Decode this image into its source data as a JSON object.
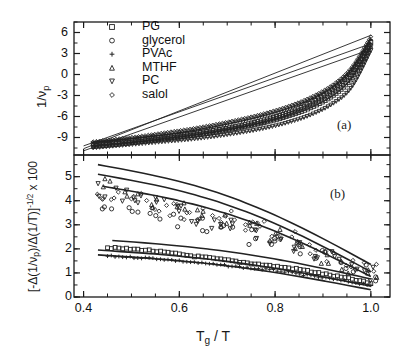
{
  "figure": {
    "xlabel_main": "T",
    "xlabel_sub": "g",
    "xlabel_tail": " / T",
    "panel_a_label": "(a)",
    "panel_b_label": "(b)",
    "ylabel_a_main": "1/",
    "ylabel_a_nu": "ν",
    "ylabel_a_sub": "p",
    "ylabel_b_pre": "[-Δ(1/",
    "ylabel_b_nu": "ν",
    "ylabel_b_sub": "p",
    "ylabel_b_mid": ")/Δ(1/T)]",
    "ylabel_b_sup": "-1/2",
    "ylabel_b_tail": " x 100"
  },
  "legend": {
    "title": "",
    "entries": [
      {
        "label": "PG",
        "marker": "square",
        "marker_icon": "square-marker-icon"
      },
      {
        "label": "glycerol",
        "marker": "circle",
        "marker_icon": "circle-marker-icon"
      },
      {
        "label": "PVAc",
        "marker": "plus",
        "marker_icon": "plus-marker-icon"
      },
      {
        "label": "MTHF",
        "marker": "triangle-up",
        "marker_icon": "triangle-up-marker-icon"
      },
      {
        "label": "PC",
        "marker": "triangle-down",
        "marker_icon": "triangle-down-marker-icon"
      },
      {
        "label": "salol",
        "marker": "diamond",
        "marker_icon": "diamond-marker-icon"
      }
    ]
  },
  "chart_data": [
    {
      "type": "line",
      "panel": "a",
      "title": "",
      "xlabel": "T_g / T",
      "ylabel": "1/nu_p",
      "xlim": [
        0.38,
        1.04
      ],
      "ylim": [
        -11.5,
        7.5
      ],
      "xticks": [
        0.4,
        0.6,
        0.8,
        1.0
      ],
      "xtick_labels": [
        "0.4",
        "0.6",
        "0.8",
        "1.0"
      ],
      "yticks": [
        -9,
        -6,
        -3,
        0,
        3,
        6
      ],
      "ytick_labels": [
        "-9",
        "-6",
        "-3",
        "0",
        "3",
        "6"
      ],
      "grid": false,
      "legend_position": "upper-left-inside",
      "series": [
        {
          "name": "PG",
          "marker": "square",
          "x": [
            0.42,
            0.47,
            0.52,
            0.57,
            0.62,
            0.67,
            0.72,
            0.77,
            0.82,
            0.87,
            0.92,
            0.96,
            1.0
          ],
          "y": [
            -9.9,
            -9.6,
            -9.3,
            -8.9,
            -8.5,
            -8.0,
            -7.4,
            -6.6,
            -5.6,
            -4.2,
            -2.2,
            0.4,
            4.6
          ]
        },
        {
          "name": "glycerol",
          "marker": "circle",
          "x": [
            0.42,
            0.47,
            0.52,
            0.57,
            0.62,
            0.67,
            0.72,
            0.77,
            0.82,
            0.87,
            0.92,
            0.96,
            1.0
          ],
          "y": [
            -10.1,
            -9.8,
            -9.5,
            -9.1,
            -8.7,
            -8.2,
            -7.6,
            -6.9,
            -5.9,
            -4.6,
            -2.7,
            -0.2,
            4.2
          ]
        },
        {
          "name": "PVAc",
          "marker": "plus",
          "x": [
            0.42,
            0.47,
            0.52,
            0.57,
            0.62,
            0.67,
            0.72,
            0.77,
            0.82,
            0.87,
            0.92,
            0.96,
            1.0
          ],
          "y": [
            -9.7,
            -9.4,
            -9.0,
            -8.6,
            -8.1,
            -7.5,
            -6.8,
            -6.0,
            -5.0,
            -3.7,
            -1.8,
            0.7,
            5.0
          ]
        },
        {
          "name": "MTHF",
          "marker": "triangle-up",
          "x": [
            0.42,
            0.47,
            0.52,
            0.57,
            0.62,
            0.67,
            0.72,
            0.77,
            0.82,
            0.87,
            0.92,
            0.96,
            1.0
          ],
          "y": [
            -10.3,
            -10.0,
            -9.6,
            -9.2,
            -8.8,
            -8.3,
            -7.7,
            -7.0,
            -6.1,
            -4.9,
            -3.1,
            -0.6,
            4.0
          ]
        },
        {
          "name": "PC",
          "marker": "triangle-down",
          "x": [
            0.42,
            0.47,
            0.52,
            0.57,
            0.62,
            0.67,
            0.72,
            0.77,
            0.82,
            0.87,
            0.92,
            0.96,
            1.0
          ],
          "y": [
            -10.5,
            -10.2,
            -9.9,
            -9.6,
            -9.3,
            -8.9,
            -8.4,
            -7.8,
            -7.0,
            -5.9,
            -4.2,
            -1.8,
            3.4
          ]
        },
        {
          "name": "salol",
          "marker": "diamond",
          "x": [
            0.42,
            0.47,
            0.52,
            0.57,
            0.62,
            0.67,
            0.72,
            0.77,
            0.82,
            0.87,
            0.92,
            0.96,
            1.0
          ],
          "y": [
            -9.6,
            -9.2,
            -8.8,
            -8.3,
            -7.8,
            -7.2,
            -6.5,
            -5.7,
            -4.7,
            -3.4,
            -1.5,
            1.0,
            5.4
          ]
        }
      ],
      "fit_lines": [
        {
          "name": "fit-1",
          "x": [
            0.4,
            1.0
          ],
          "y": [
            -10.6,
            5.6
          ]
        },
        {
          "name": "fit-2",
          "x": [
            0.4,
            1.0
          ],
          "y": [
            -10.2,
            4.4
          ]
        },
        {
          "name": "fit-3",
          "x": [
            0.4,
            1.0
          ],
          "y": [
            -10.9,
            3.6
          ]
        }
      ]
    },
    {
      "type": "scatter",
      "panel": "b",
      "title": "",
      "xlabel": "T_g / T",
      "ylabel": "[-D(1/nu_p)/D(1/T)]^-1/2 x 100",
      "xlim": [
        0.38,
        1.04
      ],
      "ylim": [
        0.0,
        5.9
      ],
      "xticks": [
        0.4,
        0.6,
        0.8,
        1.0
      ],
      "xtick_labels": [
        "0.4",
        "0.6",
        "0.8",
        "1.0"
      ],
      "yticks": [
        0,
        1,
        2,
        3,
        4,
        5
      ],
      "ytick_labels": [
        "0",
        "1",
        "2",
        "3",
        "4",
        "5"
      ],
      "grid": false,
      "legend_position": "none",
      "series": [
        {
          "name": "salol",
          "marker": "diamond",
          "x": [
            0.44,
            0.47,
            0.5,
            0.53,
            0.56,
            0.59,
            0.62,
            0.65,
            0.68,
            0.71,
            0.74,
            0.77,
            0.8,
            0.84,
            0.88,
            0.92,
            0.96,
            1.0
          ],
          "y": [
            4.1,
            4.3,
            3.9,
            4.0,
            3.6,
            3.7,
            3.4,
            3.5,
            3.2,
            3.3,
            3.0,
            2.9,
            2.7,
            2.4,
            2.1,
            1.8,
            1.5,
            1.2
          ]
        },
        {
          "name": "PC",
          "marker": "triangle-down",
          "x": [
            0.44,
            0.48,
            0.52,
            0.56,
            0.6,
            0.64,
            0.68,
            0.72,
            0.76,
            0.8,
            0.84,
            0.88,
            0.92,
            0.96,
            1.0
          ],
          "y": [
            4.4,
            4.2,
            3.9,
            3.8,
            3.5,
            3.3,
            3.1,
            2.9,
            2.7,
            2.5,
            2.2,
            1.9,
            1.6,
            1.3,
            1.0
          ]
        },
        {
          "name": "MTHF",
          "marker": "triangle-up",
          "x": [
            0.45,
            0.5,
            0.55,
            0.6,
            0.65,
            0.7,
            0.75,
            0.8,
            0.85,
            0.9,
            0.95,
            1.0
          ],
          "y": [
            4.6,
            4.3,
            4.0,
            3.7,
            3.4,
            3.1,
            2.8,
            2.5,
            2.1,
            1.7,
            1.3,
            0.9
          ]
        },
        {
          "name": "glycerol",
          "marker": "circle",
          "x": [
            0.45,
            0.5,
            0.55,
            0.6,
            0.65,
            0.7,
            0.75,
            0.8,
            0.85,
            0.9,
            0.95,
            1.0
          ],
          "y": [
            3.8,
            3.6,
            3.4,
            3.2,
            3.0,
            2.8,
            2.5,
            2.2,
            1.9,
            1.6,
            1.3,
            1.0
          ]
        },
        {
          "name": "PG",
          "marker": "square",
          "x": [
            0.45,
            0.49,
            0.53,
            0.57,
            0.61,
            0.65,
            0.69,
            0.73,
            0.77,
            0.81,
            0.85,
            0.89,
            0.93,
            0.97,
            1.0
          ],
          "y": [
            2.05,
            2.0,
            1.95,
            1.85,
            1.75,
            1.65,
            1.55,
            1.45,
            1.35,
            1.25,
            1.15,
            1.0,
            0.85,
            0.7,
            0.55
          ]
        },
        {
          "name": "PVAc",
          "marker": "plus",
          "x": [
            0.45,
            0.5,
            0.55,
            0.6,
            0.65,
            0.7,
            0.75,
            0.8,
            0.85,
            0.9,
            0.95,
            1.0
          ],
          "y": [
            1.7,
            1.65,
            1.6,
            1.5,
            1.4,
            1.3,
            1.2,
            1.1,
            0.95,
            0.8,
            0.65,
            0.5
          ]
        }
      ],
      "fit_lines": [
        {
          "name": "fit-b1",
          "x": [
            0.43,
            1.0
          ],
          "y": [
            5.5,
            1.35
          ]
        },
        {
          "name": "fit-b2",
          "x": [
            0.43,
            1.0
          ],
          "y": [
            5.1,
            1.05
          ]
        },
        {
          "name": "fit-b3",
          "x": [
            0.44,
            1.0
          ],
          "y": [
            4.6,
            0.85
          ]
        },
        {
          "name": "fit-b4",
          "x": [
            0.46,
            1.0
          ],
          "y": [
            2.35,
            0.75
          ]
        },
        {
          "name": "fit-b5",
          "x": [
            0.43,
            1.0
          ],
          "y": [
            1.95,
            0.45
          ]
        },
        {
          "name": "fit-b6",
          "x": [
            0.43,
            1.0
          ],
          "y": [
            1.75,
            0.3
          ]
        }
      ]
    }
  ],
  "colors": {
    "axis": "#1a1a1a",
    "data": "#222222",
    "background": "#ffffff"
  }
}
